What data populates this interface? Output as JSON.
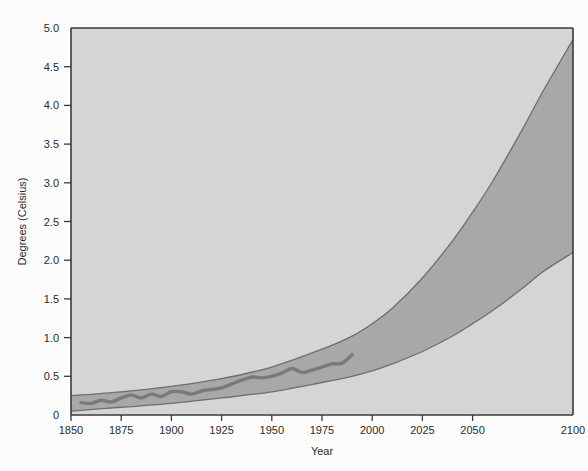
{
  "chart_data": {
    "type": "area",
    "title": "",
    "subtitle": "",
    "xlabel": "Year",
    "ylabel": "Degrees (Celsius)",
    "xlim": [
      1850,
      2100
    ],
    "ylim": [
      0,
      5.0
    ],
    "grid": false,
    "legend": null,
    "legend_position": "none",
    "annotations": [],
    "xticks": [
      1850,
      1875,
      1900,
      1925,
      1950,
      1975,
      2000,
      2025,
      2050,
      2100
    ],
    "xtick_labels": [
      "1850",
      "1875",
      "1900",
      "1925",
      "1950",
      "1975",
      "2000",
      "2025",
      "2050",
      "2100"
    ],
    "yticks": [
      0,
      0.5,
      1.0,
      1.5,
      2.0,
      2.5,
      3.0,
      3.5,
      4.0,
      4.5,
      5.0
    ],
    "ytick_labels": [
      "0",
      "0.5",
      "1.0",
      "1.5",
      "2.0",
      "2.5",
      "3.0",
      "3.5",
      "4.0",
      "4.5",
      "5.0"
    ],
    "colors": {
      "page_background": "#fcfcfc",
      "plot_background": "#d5d5d5",
      "band_fill": "#a8a8a8",
      "band_edge": "#6e6e6e",
      "observed_line": "#7a7a7a",
      "axis": "#3a3a3a",
      "text": "#2b2b2b"
    },
    "series": [
      {
        "name": "Projected warming range (upper bound)",
        "type": "line",
        "x": [
          1850,
          1875,
          1900,
          1925,
          1950,
          1975,
          1990,
          2000,
          2010,
          2025,
          2040,
          2050,
          2060,
          2075,
          2085,
          2100
        ],
        "values": [
          0.25,
          0.3,
          0.37,
          0.47,
          0.62,
          0.85,
          1.02,
          1.18,
          1.38,
          1.77,
          2.25,
          2.62,
          3.02,
          3.7,
          4.18,
          4.85
        ]
      },
      {
        "name": "Projected warming range (lower bound)",
        "type": "line",
        "x": [
          1850,
          1875,
          1900,
          1925,
          1950,
          1975,
          1990,
          2000,
          2010,
          2025,
          2040,
          2050,
          2060,
          2075,
          2085,
          2100
        ],
        "values": [
          0.05,
          0.1,
          0.15,
          0.22,
          0.3,
          0.42,
          0.5,
          0.57,
          0.66,
          0.82,
          1.02,
          1.18,
          1.35,
          1.64,
          1.85,
          2.1
        ]
      },
      {
        "name": "Observed temperature",
        "type": "line",
        "x": [
          1855,
          1860,
          1865,
          1870,
          1875,
          1880,
          1885,
          1890,
          1895,
          1900,
          1905,
          1910,
          1915,
          1920,
          1925,
          1930,
          1935,
          1940,
          1945,
          1950,
          1955,
          1960,
          1965,
          1970,
          1975,
          1980,
          1985,
          1990
        ],
        "values": [
          0.16,
          0.15,
          0.19,
          0.17,
          0.22,
          0.26,
          0.22,
          0.27,
          0.24,
          0.3,
          0.3,
          0.27,
          0.31,
          0.33,
          0.35,
          0.4,
          0.45,
          0.49,
          0.48,
          0.5,
          0.54,
          0.6,
          0.55,
          0.58,
          0.62,
          0.66,
          0.67,
          0.78
        ]
      }
    ]
  }
}
